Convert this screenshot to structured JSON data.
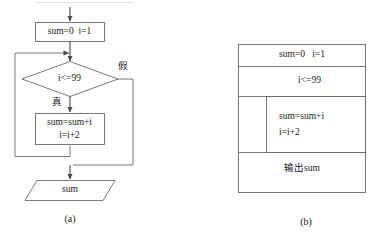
{
  "figure": {
    "title_a": "(a)",
    "title_b": "(b)"
  },
  "flowchart_a": {
    "caption": "(a)",
    "nodes": {
      "init": {
        "shape": "process",
        "text": "sum=0  i=1"
      },
      "condition": {
        "shape": "decision",
        "text": "i<=99"
      },
      "body": {
        "shape": "process",
        "line1": "sum=sum+i",
        "line2": "i=i+2"
      },
      "output": {
        "shape": "parallelogram",
        "text": "sum"
      }
    },
    "edge_labels": {
      "false": "假",
      "true": "真"
    }
  },
  "ns_chart_b": {
    "caption": "(b)",
    "rows": [
      {
        "name": "init",
        "text": "sum=0   i=1"
      },
      {
        "name": "condition",
        "text": "i<=99"
      },
      {
        "name": "loop-body-line1",
        "text": "sum=sum+i"
      },
      {
        "name": "loop-body-line2",
        "text": "i=i+2"
      },
      {
        "name": "output",
        "text": "输出sum"
      }
    ]
  },
  "style": {
    "stroke": "#555555",
    "text": "#1a1a1a",
    "background": "#ffffff"
  }
}
